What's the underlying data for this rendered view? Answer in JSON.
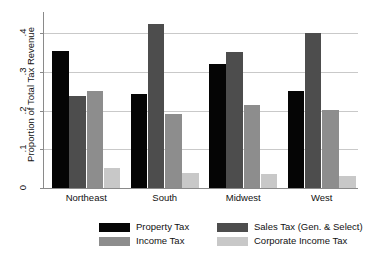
{
  "chart_data": {
    "type": "bar",
    "title": "",
    "subtitle": "",
    "xlabel": "",
    "ylabel": "Proportion of Total Tax Revenue",
    "categories": [
      "Northeast",
      "South",
      "Midwest",
      "West"
    ],
    "ylim": [
      0,
      0.45
    ],
    "yticks": [
      0,
      0.1,
      0.2,
      0.3,
      0.4
    ],
    "ytick_labels": [
      "0",
      ".1",
      ".2",
      ".3",
      ".4"
    ],
    "grid": true,
    "legend_position": "bottom",
    "series": [
      {
        "name": "Property Tax",
        "color": "#050505",
        "values": [
          0.355,
          0.243,
          0.322,
          0.251
        ]
      },
      {
        "name": "Sales Tax (Gen. & Select)",
        "color": "#4d4d4d",
        "values": [
          0.238,
          0.425,
          0.353,
          0.402
        ]
      },
      {
        "name": "Income Tax",
        "color": "#8d8d8d",
        "values": [
          0.252,
          0.192,
          0.215,
          0.203
        ]
      },
      {
        "name": "Corporate Income Tax",
        "color": "#c8c8c8",
        "values": [
          0.053,
          0.04,
          0.036,
          0.03
        ]
      }
    ]
  },
  "axis": {
    "y_title": "Proportion of Total Tax Revenue",
    "tick0": "0",
    "tick1": ".1",
    "tick2": ".2",
    "tick3": ".3",
    "tick4": ".4"
  },
  "categories": {
    "c0": "Northeast",
    "c1": "South",
    "c2": "Midwest",
    "c3": "West"
  },
  "legend": {
    "item0": "Property Tax",
    "item1": "Sales Tax (Gen. & Select)",
    "item2": "Income Tax",
    "item3": "Corporate Income Tax"
  }
}
